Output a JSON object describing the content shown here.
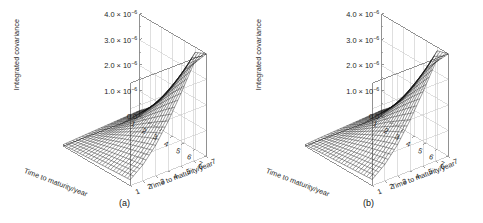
{
  "figure": {
    "panels": [
      {
        "tag": "(a)",
        "ylabel": "Integrated covariance",
        "xlabel_left": "Time to maturity/year",
        "xlabel_right": "Time to maturity/year",
        "yticks": [
          "4.0 × 10",
          "3.0 × 10",
          "2.0 × 10",
          "1.0 × 10",
          "0.0"
        ],
        "yexp": "−6",
        "xticks_left": [
          "1",
          "2",
          "3",
          "4",
          "5",
          "6",
          "7"
        ],
        "xticks_right": [
          "1",
          "2",
          "3",
          "4",
          "5",
          "6",
          "7"
        ]
      },
      {
        "tag": "(b)",
        "ylabel": "Integrated covariance",
        "xlabel_left": "Time to maturity/year",
        "xlabel_right": "Time to maturity/year",
        "yticks": [
          "4.0 × 10",
          "3.0 × 10",
          "2.0 × 10",
          "1.0 × 10",
          "0.0"
        ],
        "yexp": "−6",
        "xticks_left": [
          "1",
          "2",
          "3",
          "4",
          "5",
          "6",
          "7"
        ],
        "xticks_right": [
          "1",
          "2",
          "3",
          "4",
          "5",
          "6",
          "7"
        ]
      }
    ],
    "colors": {
      "mesh": "#111111",
      "frame": "#8a8a8a",
      "grid": "#c9c9c9",
      "background": "#ffffff",
      "text": "#1c1c1c"
    }
  },
  "chart_data": [
    {
      "type": "surface",
      "panel": "(a)",
      "title": "",
      "xlabel": "Time to maturity/year",
      "ylabel": "Time to maturity/year",
      "zlabel": "Integrated covariance",
      "xlim": [
        1,
        7
      ],
      "ylim": [
        1,
        7
      ],
      "zlim": [
        0.0,
        4e-06
      ],
      "ztick_values": [
        0.0,
        1e-06,
        2e-06,
        3e-06,
        4e-06
      ],
      "ztick_labels": [
        "0.0",
        "1.0 × 10⁻⁶",
        "2.0 × 10⁻⁶",
        "3.0 × 10⁻⁶",
        "4.0 × 10⁻⁶"
      ],
      "xtick_values": [
        1,
        2,
        3,
        4,
        5,
        6,
        7
      ],
      "ytick_values": [
        1,
        2,
        3,
        4,
        5,
        6,
        7
      ],
      "grid": true,
      "legend": "none",
      "description": "Wireframe mesh surface: integrated covariance increases monotonically with both maturities, forming a valley along the diagonal and a sharp peak at (7,7) reaching 4.0e-6.",
      "x": [
        1,
        2,
        3,
        4,
        5,
        6,
        7
      ],
      "y": [
        1,
        2,
        3,
        4,
        5,
        6,
        7
      ],
      "z": [
        [
          5e-08,
          8e-08,
          1.1e-07,
          1.4e-07,
          1.7e-07,
          2e-07,
          2.3e-07
        ],
        [
          8e-08,
          1.8e-07,
          2.8e-07,
          3.7e-07,
          4.6e-07,
          5.4e-07,
          6.2e-07
        ],
        [
          1.1e-07,
          2.8e-07,
          4.8e-07,
          6.8e-07,
          8.6e-07,
          1.03e-06,
          1.19e-06
        ],
        [
          1.4e-07,
          3.7e-07,
          6.8e-07,
          1.02e-06,
          1.35e-06,
          1.66e-06,
          1.95e-06
        ],
        [
          1.7e-07,
          4.6e-07,
          8.6e-07,
          1.35e-06,
          1.88e-06,
          2.38e-06,
          2.84e-06
        ],
        [
          2e-07,
          5.4e-07,
          1.03e-06,
          1.66e-06,
          2.38e-06,
          3.12e-06,
          3.8e-06
        ],
        [
          2.3e-07,
          6.2e-07,
          1.19e-06,
          1.95e-06,
          2.84e-06,
          3.8e-06,
          4e-06
        ]
      ]
    },
    {
      "type": "surface",
      "panel": "(b)",
      "title": "",
      "xlabel": "Time to maturity/year",
      "ylabel": "Time to maturity/year",
      "zlabel": "Integrated covariance",
      "xlim": [
        1,
        7
      ],
      "ylim": [
        1,
        7
      ],
      "zlim": [
        0.0,
        4e-06
      ],
      "ztick_values": [
        0.0,
        1e-06,
        2e-06,
        3e-06,
        4e-06
      ],
      "ztick_labels": [
        "0.0",
        "1.0 × 10⁻⁶",
        "2.0 × 10⁻⁶",
        "3.0 × 10⁻⁶",
        "4.0 × 10⁻⁶"
      ],
      "xtick_values": [
        1,
        2,
        3,
        4,
        5,
        6,
        7
      ],
      "ytick_values": [
        1,
        2,
        3,
        4,
        5,
        6,
        7
      ],
      "grid": true,
      "legend": "none",
      "description": "Wireframe mesh surface nearly identical in shape to panel (a): integrated covariance rises with both maturities to a peak of 4.0e-6 at (7,7).",
      "x": [
        1,
        2,
        3,
        4,
        5,
        6,
        7
      ],
      "y": [
        1,
        2,
        3,
        4,
        5,
        6,
        7
      ],
      "z": [
        [
          5e-08,
          9e-08,
          1.2e-07,
          1.5e-07,
          1.8e-07,
          2.1e-07,
          2.4e-07
        ],
        [
          9e-08,
          1.9e-07,
          2.9e-07,
          3.9e-07,
          4.8e-07,
          5.6e-07,
          6.4e-07
        ],
        [
          1.2e-07,
          2.9e-07,
          5e-07,
          7e-07,
          8.9e-07,
          1.06e-06,
          1.22e-06
        ],
        [
          1.5e-07,
          3.9e-07,
          7e-07,
          1.05e-06,
          1.39e-06,
          1.7e-06,
          2e-06
        ],
        [
          1.8e-07,
          4.8e-07,
          8.9e-07,
          1.39e-06,
          1.93e-06,
          2.44e-06,
          2.9e-06
        ],
        [
          2.1e-07,
          5.6e-07,
          1.06e-06,
          1.7e-06,
          2.44e-06,
          3.18e-06,
          3.86e-06
        ],
        [
          2.4e-07,
          6.4e-07,
          1.22e-06,
          2e-06,
          2.9e-06,
          3.86e-06,
          4e-06
        ]
      ]
    }
  ]
}
